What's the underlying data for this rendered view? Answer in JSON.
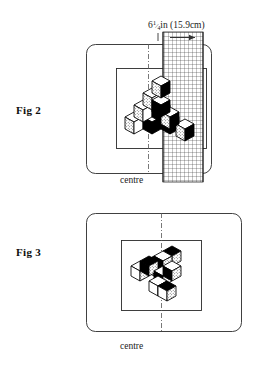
{
  "document": {
    "type": "technical-illustration",
    "background_color": "#ffffff",
    "ink_color": "#111111"
  },
  "figures": [
    {
      "id": "fig2",
      "label": "Fig 2",
      "centre_label": "centre",
      "dimension": {
        "value_imperial": "6",
        "fraction": "1/4",
        "unit_imperial": "in",
        "value_metric": "(15.9cm)",
        "full_text": "6¼in (15.9cm)"
      },
      "trim_label": "trim",
      "frame": {
        "x": 86,
        "y": 44,
        "width": 125,
        "height": 129,
        "rounded": true
      },
      "inner_rect": {
        "x": 116,
        "y": 68,
        "width": 90,
        "height": 80
      },
      "centre_line": {
        "x": 148,
        "y1": 44,
        "y2": 173,
        "style": "dash-dot"
      },
      "grid_strip": {
        "x": 163,
        "y": 32,
        "width": 40,
        "height": 150,
        "cell": 4
      },
      "cubes": {
        "arrangement": "stepped-pyramid",
        "count": 10,
        "rows": 3
      }
    },
    {
      "id": "fig3",
      "label": "Fig 3",
      "centre_label": "centre",
      "frame": {
        "x": 86,
        "y": 213,
        "width": 155,
        "height": 118,
        "rounded": true
      },
      "inner_rect": {
        "x": 121,
        "y": 240,
        "width": 80,
        "height": 70
      },
      "centre_line": {
        "x": 161,
        "y1": 213,
        "y2": 331,
        "style": "dash-dot"
      },
      "cubes": {
        "arrangement": "flat-diagonal-cluster",
        "count": 9,
        "rows": 3
      }
    }
  ],
  "colors": {
    "line": "#1a1a1a",
    "cube_dark_face": "#000000",
    "cube_light_face": "#ffffff",
    "cube_stipple_face": "#d8d8d8",
    "grid_line": "#333333"
  }
}
